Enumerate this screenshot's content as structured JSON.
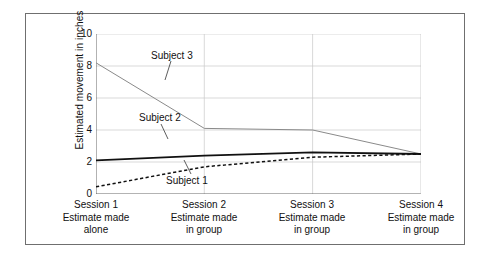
{
  "chart_data": {
    "type": "line",
    "title": "",
    "xlabel": "",
    "ylabel": "Estimated movement in inches",
    "ylim": [
      0,
      10
    ],
    "yticks": [
      10,
      8,
      6,
      4,
      2,
      0
    ],
    "grid": true,
    "legend_position": "inline-annotations",
    "categories": [
      "Session 1",
      "Session 2",
      "Session 3",
      "Session 4"
    ],
    "category_sublabels": [
      [
        "Estimate made",
        "alone"
      ],
      [
        "Estimate made",
        "in group"
      ],
      [
        "Estimate made",
        "in group"
      ],
      [
        "Estimate made",
        "in group"
      ]
    ],
    "series": [
      {
        "name": "Subject 3",
        "style": "thin-solid-gray",
        "color": "#8a8a8a",
        "values": [
          8.2,
          4.1,
          4.0,
          2.5
        ]
      },
      {
        "name": "Subject 2",
        "style": "thick-solid-black",
        "color": "#111111",
        "values": [
          2.1,
          2.4,
          2.6,
          2.5
        ]
      },
      {
        "name": "Subject 1",
        "style": "dashed-black",
        "color": "#111111",
        "values": [
          0.45,
          1.7,
          2.3,
          2.5
        ]
      }
    ],
    "annotations": [
      {
        "text": "Subject 3"
      },
      {
        "text": "Subject 2"
      },
      {
        "text": "Subject 1"
      }
    ]
  }
}
